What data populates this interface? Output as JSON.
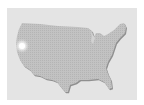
{
  "map": {
    "region": "United States (contiguous)",
    "colors": {
      "background": "#ffffff",
      "panel": "#e4e4e4",
      "land": "#bdbdbd",
      "land_shadow": "#8a8a8a"
    },
    "marker": {
      "label": "location-marker",
      "color": "#ffffff"
    }
  }
}
